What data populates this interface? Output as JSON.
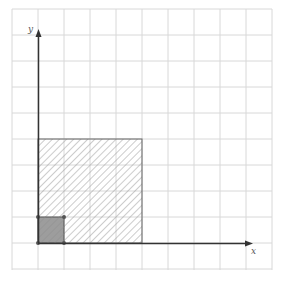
{
  "diagram": {
    "type": "coordinate-grid",
    "grid": {
      "x0": 12,
      "y0": 9,
      "spacing": 26,
      "cols": 10,
      "rows": 10,
      "color": "#d8d8d8"
    },
    "origin": {
      "x": 39,
      "y": 243
    },
    "axes": {
      "x_label": "x",
      "y_label": "y",
      "color": "#333333"
    },
    "shapes": [
      {
        "name": "large-hatched-square",
        "units": 4,
        "fill": "hatched",
        "stroke": "#555555"
      },
      {
        "name": "small-shaded-square",
        "units": 1,
        "fill": "#8a8a8a",
        "stroke": "#555555",
        "corner_dots": true
      }
    ]
  }
}
